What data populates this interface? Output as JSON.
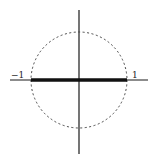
{
  "diagram": {
    "labels": {
      "left": "−1",
      "right": "1"
    },
    "colors": {
      "axis": "#1a1a1a",
      "circle": "#444444",
      "segment": "#111111",
      "background": "#ffffff"
    }
  }
}
